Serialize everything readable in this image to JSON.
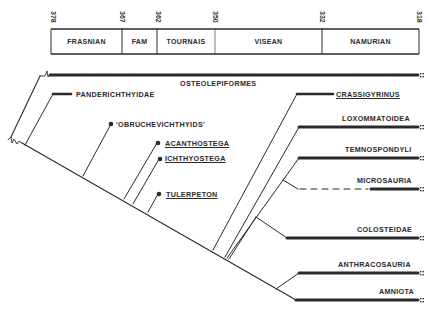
{
  "timescale": {
    "ticks": [
      {
        "label": "378",
        "x": 57
      },
      {
        "label": "367",
        "x": 126
      },
      {
        "label": "362",
        "x": 161
      },
      {
        "label": "350",
        "x": 219
      },
      {
        "label": "332",
        "x": 326
      },
      {
        "label": "318",
        "x": 422
      }
    ],
    "periods": [
      {
        "label": "FRASNIAN",
        "x1": 51,
        "x2": 122
      },
      {
        "label": "FAM",
        "x1": 122,
        "x2": 157
      },
      {
        "label": "TOURNAIS",
        "x1": 157,
        "x2": 215
      },
      {
        "label": "VISEAN",
        "x1": 215,
        "x2": 322
      },
      {
        "label": "NAMURIAN",
        "x1": 322,
        "x2": 419
      }
    ]
  },
  "taxa": {
    "osteolepiformes": "OSTEOLEPIFORMES",
    "panderichthyidae": "PANDERICHTHYIDAE",
    "obruchevichthyids": "'OBRUCHEVICHTHYIDS'",
    "acanthostega": "ACANTHOSTEGA",
    "ichthyostega": "ICHTHYOSTEGA",
    "tulerpeton": "TULERPETON",
    "crassigyrinus": "CRASSIGYRINUS",
    "loxommatoidea": "LOXOMMATOIDEA",
    "temnospondyli": "TEMNOSPONDYLI",
    "microsauria": "MICROSAURIA",
    "colosteidae": "COLOSTEIDAE",
    "anthracosauria": "ANTHRACOSAURIA",
    "amniota": "AMNIOTA"
  },
  "colors": {
    "ink": "#2a2a2a",
    "background": "#ffffff"
  }
}
